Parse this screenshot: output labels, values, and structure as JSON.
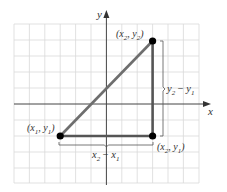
{
  "diagram": {
    "type": "distance-formula-right-triangle",
    "axes": {
      "x_label": "x",
      "y_label": "y"
    },
    "grid": {
      "columns": 12,
      "rows": 10,
      "color": "#d9d9d9"
    },
    "points": [
      {
        "id": "p1",
        "label": "(x",
        "sub1": "1",
        "mid": ", y",
        "sub2": "1",
        "end": ")"
      },
      {
        "id": "p2",
        "label": "(x",
        "sub1": "2",
        "mid": ", y",
        "sub2": "2",
        "end": ")"
      },
      {
        "id": "p3",
        "label": "(x",
        "sub1": "2",
        "mid": ", y",
        "sub2": "1",
        "end": ")"
      }
    ],
    "dimensions": {
      "horizontal": {
        "a": "x",
        "a_sub": "2",
        "op": " − ",
        "b": "x",
        "b_sub": "1"
      },
      "vertical": {
        "a": "y",
        "a_sub": "2",
        "op": " − ",
        "b": "y",
        "b_sub": "1"
      }
    },
    "colors": {
      "axis": "#444444",
      "hypotenuse": "#6e6e6e",
      "legs": "#555555",
      "points": "#000000",
      "bracket": "#555555"
    }
  }
}
